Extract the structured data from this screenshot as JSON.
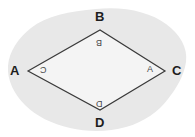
{
  "figure": {
    "type": "geometry-diagram",
    "shape_name": "rhombus",
    "canvas": {
      "width": 195,
      "height": 137,
      "background_color": "#ffffff"
    },
    "blob": {
      "name": "background-blob",
      "fill_color": "#e8e8e8",
      "description": "irregular light gray cloud shape behind the rhombus"
    },
    "rhombus": {
      "fill_color": "#f4f4f4",
      "stroke_color": "#3a3a3a",
      "stroke_width": 1.2,
      "vertices": [
        {
          "id": "A",
          "x": 28,
          "y": 71
        },
        {
          "id": "B",
          "x": 100,
          "y": 30
        },
        {
          "id": "C",
          "x": 165,
          "y": 71
        },
        {
          "id": "D",
          "x": 100,
          "y": 110
        }
      ]
    },
    "outer_labels": [
      {
        "id": "A",
        "text": "A"
      },
      {
        "id": "B",
        "text": "B"
      },
      {
        "id": "C",
        "text": "C"
      },
      {
        "id": "D",
        "text": "D"
      }
    ],
    "inner_labels": [
      {
        "id": "A",
        "text": "C",
        "rotated": true
      },
      {
        "id": "B",
        "text": "B",
        "rotated": true
      },
      {
        "id": "C",
        "text": "A",
        "rotated": false
      },
      {
        "id": "D",
        "text": "D",
        "rotated": true
      }
    ]
  }
}
